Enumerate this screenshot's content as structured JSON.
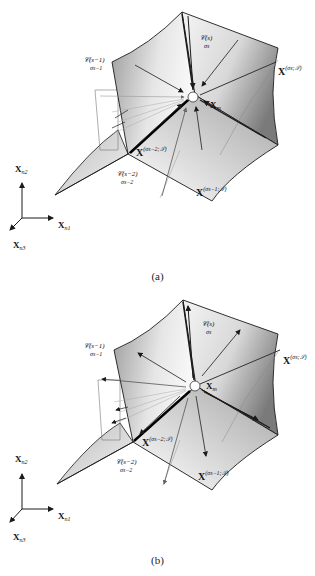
{
  "figure": {
    "panels": [
      {
        "id": "a",
        "caption": "(a)",
        "arrow_direction": "inward",
        "labels": {
          "surface_s": "𝒞(s)",
          "surface_s_sub": "σs",
          "surface_s1": "𝒞(s−1)",
          "surface_s1_sub": "σs−1",
          "surface_s2": "𝒞(s−2)",
          "surface_s2_sub": "σs−2",
          "xm": "X",
          "xm_sub": "m",
          "x_sigma_s": "X",
          "x_sigma_s_sup": "(σs;𝒮)",
          "x_sigma_s1": "X",
          "x_sigma_s1_sup": "(σs−1;𝒮)",
          "x_sigma_s2": "X",
          "x_sigma_s2_sup": "(σs−2;𝒮)"
        }
      },
      {
        "id": "b",
        "caption": "(b)",
        "arrow_direction": "outward",
        "labels": {
          "surface_s": "𝒞(s)",
          "surface_s_sub": "σs",
          "surface_s1": "𝒞(s−1)",
          "surface_s1_sub": "σs−1",
          "surface_s2": "𝒞(s−2)",
          "surface_s2_sub": "σs−2",
          "xm": "X",
          "xm_sub": "m",
          "x_sigma_s": "X",
          "x_sigma_s_sup": "(σs;𝒮)",
          "x_sigma_s1": "X",
          "x_sigma_s1_sup": "(σs−1;𝒮)",
          "x_sigma_s2": "X",
          "x_sigma_s2_sup": "(σs−2;𝒮)"
        }
      }
    ],
    "axes": {
      "n1": "X",
      "n1_sub": "n1",
      "n2": "X",
      "n2_sub": "n2",
      "n3": "X",
      "n3_sub": "n3"
    },
    "colors": {
      "surface_dark": "#8a8a8a",
      "surface_light": "#f2f2f2",
      "line": "#1a1a1a",
      "thin_line": "#555555"
    }
  }
}
